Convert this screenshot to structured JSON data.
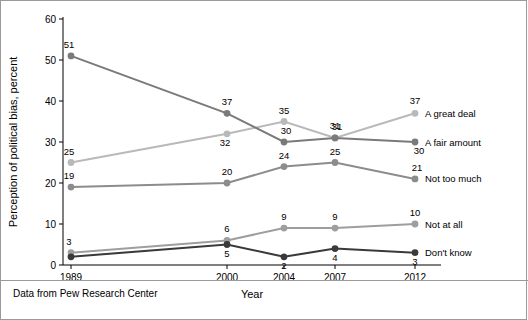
{
  "caption": "Data from Pew Research Center",
  "chart_data": {
    "type": "line",
    "title": "",
    "xlabel": "Year",
    "ylabel": "Perception of political bias, percent",
    "x": [
      1989,
      2000,
      2004,
      2007,
      2012
    ],
    "xtick_labels": [
      "1989",
      "2000",
      "2004",
      "2007",
      "2012"
    ],
    "ylim": [
      0,
      60
    ],
    "ytick_labels": [
      "0",
      "10",
      "20",
      "30",
      "40",
      "50",
      "60"
    ],
    "yticks": [
      0,
      10,
      20,
      30,
      40,
      50,
      60
    ],
    "grid": false,
    "legend_position": "right-inline",
    "series": [
      {
        "name": "A great deal",
        "color": "#b9b9b9",
        "values": [
          25,
          32,
          35,
          31,
          37
        ],
        "labels": [
          "25",
          "32",
          "35",
          "31",
          "37"
        ]
      },
      {
        "name": "A fair amount",
        "color": "#7a7a7a",
        "values": [
          51,
          37,
          30,
          31,
          30
        ],
        "labels": [
          "51",
          "37",
          "30",
          "31",
          "30"
        ]
      },
      {
        "name": "Not too much",
        "color": "#8c8c8c",
        "values": [
          19,
          20,
          24,
          25,
          21
        ],
        "labels": [
          "19",
          "20",
          "24",
          "25",
          "21"
        ]
      },
      {
        "name": "Not at all",
        "color": "#9e9e9e",
        "values": [
          3,
          6,
          9,
          9,
          10
        ],
        "labels": [
          "3",
          "6",
          "9",
          "9",
          "10"
        ]
      },
      {
        "name": "Don't know",
        "color": "#3a3a3a",
        "values": [
          2,
          5,
          2,
          4,
          3
        ],
        "labels": [
          "",
          "5",
          "2",
          "4",
          "3"
        ]
      }
    ]
  }
}
